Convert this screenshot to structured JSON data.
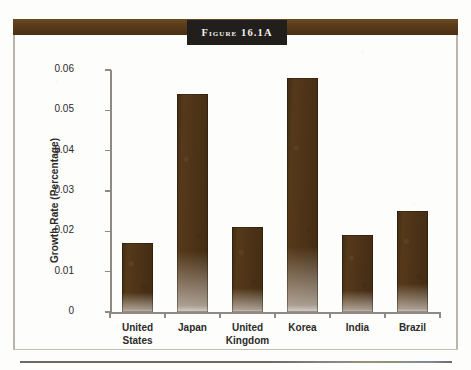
{
  "figure": {
    "title": "Figure 16.1A",
    "bar_color": "#4a3317",
    "plaque_color": "#221e1c",
    "band_color": "#5a3c1b",
    "frame_color": "#b9b4ae"
  },
  "chart_data": {
    "type": "bar",
    "title": "Figure 16.1A",
    "xlabel": "",
    "ylabel": "Growth Rate (Percentage)",
    "categories": [
      "United States",
      "Japan",
      "United Kingdom",
      "Korea",
      "India",
      "Brazil"
    ],
    "category_lines": [
      [
        "United",
        "States"
      ],
      [
        "Japan",
        ""
      ],
      [
        "United",
        "Kingdom"
      ],
      [
        "Korea",
        ""
      ],
      [
        "India",
        ""
      ],
      [
        "Brazil",
        ""
      ]
    ],
    "values": [
      0.017,
      0.054,
      0.021,
      0.058,
      0.019,
      0.025
    ],
    "ylim": [
      0,
      0.06
    ],
    "yticks": [
      0,
      0.01,
      0.02,
      0.03,
      0.04,
      0.05,
      0.06
    ],
    "ytick_labels": [
      "0",
      "0.01",
      "0.02",
      "0.03",
      "0.04",
      "0.05",
      "0.06"
    ],
    "grid": false,
    "legend": false
  }
}
